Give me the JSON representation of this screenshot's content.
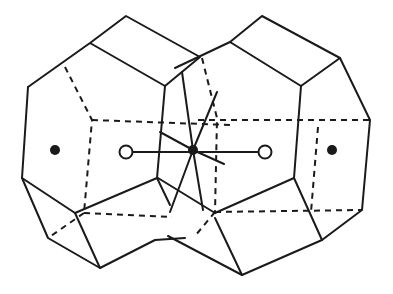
{
  "figure": {
    "colors": {
      "line": "#1a1a1a",
      "background": "#ffffff"
    },
    "markers": {
      "filled": [
        {
          "x": 55,
          "y": 150
        },
        {
          "x": 193,
          "y": 150
        },
        {
          "x": 332,
          "y": 150
        }
      ],
      "open": [
        {
          "x": 126,
          "y": 152
        },
        {
          "x": 265,
          "y": 152
        }
      ]
    }
  }
}
